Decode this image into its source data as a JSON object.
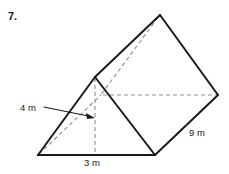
{
  "problem": {
    "number": "7."
  },
  "figure": {
    "name": "triangular-prism",
    "stroke_color": "#1a1a1a",
    "hidden_stroke_color": "#9a9a9a",
    "background": "#ffffff"
  },
  "labels": {
    "height": "4 m",
    "base": "3 m",
    "depth": "9 m"
  },
  "geometry": {
    "front_triangle": {
      "bottom_left": [
        38,
        155
      ],
      "bottom_right": [
        155,
        155
      ],
      "apex": [
        95,
        77
      ]
    },
    "back_triangle": {
      "bottom_left_hidden": [
        101,
        95
      ],
      "bottom_right": [
        218,
        95
      ],
      "apex": [
        160,
        15
      ]
    },
    "height_line": {
      "from": [
        95,
        77
      ],
      "to": [
        95,
        155
      ]
    },
    "leader": {
      "from": [
        44,
        108
      ],
      "elbow": [
        62,
        108
      ],
      "arrow_tip": [
        94,
        118
      ]
    }
  }
}
